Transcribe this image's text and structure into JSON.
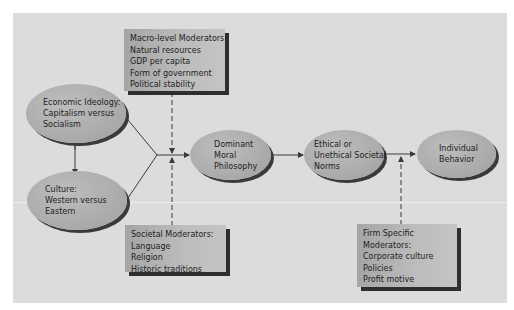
{
  "diagram": {
    "nodes": {
      "economic_ideology": {
        "lines": [
          "Economic Ideology:",
          "Capitalism versus",
          "Socialism"
        ]
      },
      "culture": {
        "lines": [
          "Culture:",
          "Western versus",
          "Eastern"
        ]
      },
      "dominant_moral_philosophy": {
        "lines": [
          "Dominant",
          "Moral",
          "Philosophy"
        ]
      },
      "societal_norms": {
        "lines": [
          "Ethical or",
          "Unethical Societal",
          "Norms"
        ]
      },
      "individual_behavior": {
        "lines": [
          "Individual",
          "Behavior"
        ]
      }
    },
    "moderators": {
      "macro_level": {
        "title": "Macro-level Moderators:",
        "items": [
          "Natural resources",
          "GDP per capita",
          "Form of government",
          "Political stability"
        ]
      },
      "societal": {
        "title": "Societal Moderators:",
        "items": [
          "Language",
          "Religion",
          "Historic traditions"
        ]
      },
      "firm_specific": {
        "title_lines": [
          "Firm Specific",
          "Moderators:"
        ],
        "items": [
          "Corporate culture",
          "Policies",
          "Profit motive"
        ]
      }
    },
    "colors": {
      "background": "#dcdcdc",
      "node_fill": "#aaaaaa",
      "shadow": "#2e2e2e",
      "line": "#4a4a4a"
    }
  }
}
